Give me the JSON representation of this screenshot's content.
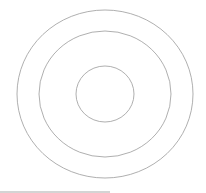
{
  "diagram": {
    "type": "concentric-circles",
    "stroke_color": "#9a9a9a",
    "background": "#ffffff",
    "circles": [
      {
        "name": "outer",
        "cx": 105,
        "cy": 94,
        "rx": 88,
        "ry": 84
      },
      {
        "name": "middle",
        "cx": 105,
        "cy": 94,
        "rx": 66,
        "ry": 63
      },
      {
        "name": "inner",
        "cx": 105,
        "cy": 94,
        "rx": 29,
        "ry": 28
      }
    ],
    "bottom_bar_color": "#d4d4d4"
  }
}
